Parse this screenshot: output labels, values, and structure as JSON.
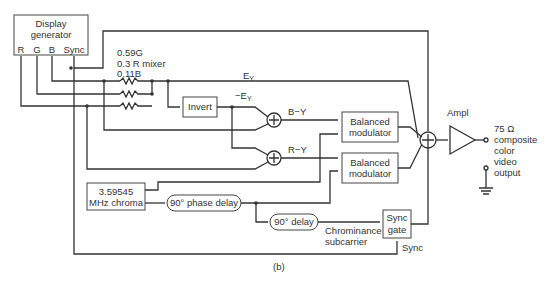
{
  "diagram": {
    "caption": "(b)",
    "blocks": {
      "display_generator": {
        "line1": "Display",
        "line2": "generator",
        "ports": [
          "R",
          "G",
          "B",
          "Sync"
        ]
      },
      "mixer": {
        "line1": "0.59G",
        "line2": "0.3  R  mixer",
        "line3": "0.11B"
      },
      "invert": "Invert",
      "balanced_modulator_1": {
        "line1": "Balanced",
        "line2": "modulator"
      },
      "balanced_modulator_2": {
        "line1": "Balanced",
        "line2": "modulator"
      },
      "chroma_osc": {
        "line1": "3.59545",
        "line2": "MHz chroma"
      },
      "phase_delay": "90° phase delay",
      "delay_90": "90° delay",
      "sync_gate": {
        "line1": "Sync",
        "line2": "gate"
      },
      "amplifier": "Ampl"
    },
    "labels": {
      "ey": "E",
      "ey_sub": "Y",
      "neg_ey": "−E",
      "neg_ey_sub": "Y",
      "b_minus_y": "B−Y",
      "r_minus_y": "R−Y",
      "chrominance": "Chrominance",
      "subcarrier": "subcarrier",
      "sync": "Sync",
      "output_ohm": "75 Ω",
      "output_line1": "composite",
      "output_line2": "color",
      "output_line3": "video",
      "output_line4": "output"
    }
  }
}
